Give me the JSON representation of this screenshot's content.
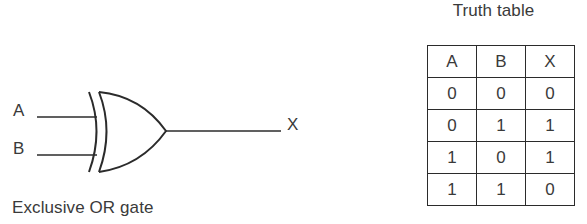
{
  "diagram": {
    "caption": "Exclusive OR gate",
    "inputs": [
      {
        "label": "A"
      },
      {
        "label": "B"
      }
    ],
    "output": {
      "label": "X"
    },
    "gate_type": "xor-gate",
    "line_color": "#2b2b2b",
    "text_color": "#3a3a3a",
    "background": "#ffffff"
  },
  "truth_table": {
    "title": "Truth table",
    "headers": [
      "A",
      "B",
      "X"
    ],
    "rows": [
      [
        "0",
        "0",
        "0"
      ],
      [
        "0",
        "1",
        "1"
      ],
      [
        "1",
        "0",
        "1"
      ],
      [
        "1",
        "1",
        "0"
      ]
    ]
  }
}
